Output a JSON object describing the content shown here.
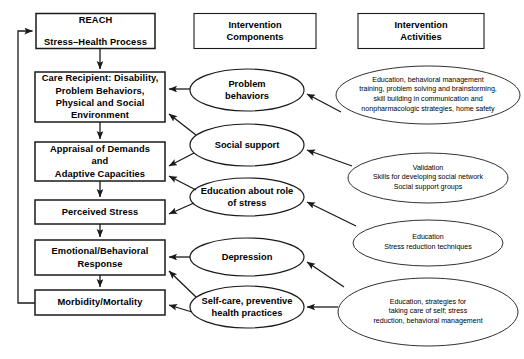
{
  "diagram": {
    "colors": {
      "stroke": "#1a1a1a",
      "background": "#ffffff",
      "text": "#000000"
    },
    "headers": [
      {
        "id": "intervention-components",
        "label": "Intervention\nComponents"
      },
      {
        "id": "intervention-activities",
        "label": "Intervention\nActivities"
      }
    ],
    "process_boxes": [
      {
        "id": "reach",
        "label": "REACH\n\nStress–Health Process"
      },
      {
        "id": "care-recipient",
        "label": "Care Recipient: Disability,\nProblem Behaviors,\nPhysical and Social\nEnvironment"
      },
      {
        "id": "appraisal",
        "label": "Appraisal of Demands\nand\nAdaptive Capacities"
      },
      {
        "id": "perceived-stress",
        "label": "Perceived Stress"
      },
      {
        "id": "emotional-response",
        "label": "Emotional/Behavioral\nResponse"
      },
      {
        "id": "morbidity",
        "label": "Morbidity/Mortality"
      }
    ],
    "component_ellipses": [
      {
        "id": "problem-behaviors",
        "label": "Problem\nbehaviors"
      },
      {
        "id": "social-support",
        "label": "Social support"
      },
      {
        "id": "education-stress-role",
        "label": "Education about role\nof stress"
      },
      {
        "id": "depression",
        "label": "Depression"
      },
      {
        "id": "self-care",
        "label": "Self-care, preventive\nhealth practices"
      }
    ],
    "activity_ellipses": [
      {
        "id": "activity-problem-behaviors",
        "label": "Education, behavioral management\ntraining, problem solving and brainstorming,\nskill building in communication and\nnonpharmacologic strategies, home safety"
      },
      {
        "id": "activity-social-support",
        "label": "Validation\nSkills for developing social network\nSocial support groups"
      },
      {
        "id": "activity-education",
        "label": "Education\nStress reduction techniques"
      },
      {
        "id": "activity-self-care",
        "label": "Education, strategies for\ntaking care of self; stress\nreduction, behavioral management"
      }
    ]
  }
}
